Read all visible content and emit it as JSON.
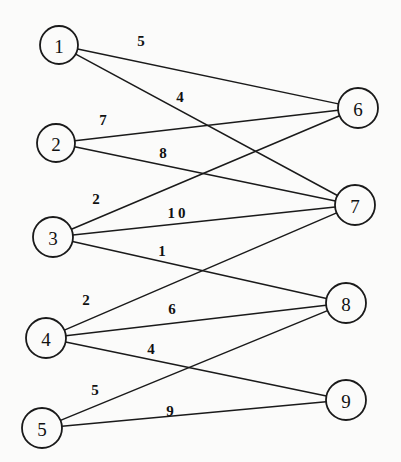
{
  "figure": {
    "kind": "bipartite-weighted-graph",
    "width": 401,
    "height": 462,
    "background_color": "#fbfbfa",
    "ink_color": "#1a1a1a"
  },
  "chart_data": {
    "type": "diagram",
    "title": "",
    "xlabel": "",
    "ylabel": "",
    "graph_type": "bipartite weighted graph",
    "left_set": [
      "1",
      "2",
      "3",
      "4",
      "5"
    ],
    "right_set": [
      "6",
      "7",
      "8",
      "9"
    ],
    "nodes": [
      {
        "id": "1",
        "label": "1",
        "side": "left",
        "cx": 59,
        "cy": 45,
        "r": 19
      },
      {
        "id": "2",
        "label": "2",
        "side": "left",
        "cx": 56,
        "cy": 143,
        "r": 19
      },
      {
        "id": "3",
        "label": "3",
        "side": "left",
        "cx": 53,
        "cy": 237,
        "r": 20
      },
      {
        "id": "4",
        "label": "4",
        "side": "left",
        "cx": 46,
        "cy": 338,
        "r": 20
      },
      {
        "id": "5",
        "label": "5",
        "side": "left",
        "cx": 42,
        "cy": 428,
        "r": 20
      },
      {
        "id": "6",
        "label": "6",
        "side": "right",
        "cx": 358,
        "cy": 108,
        "r": 20
      },
      {
        "id": "7",
        "label": "7",
        "side": "right",
        "cx": 355,
        "cy": 205,
        "r": 20
      },
      {
        "id": "8",
        "label": "8",
        "side": "right",
        "cx": 346,
        "cy": 303,
        "r": 20
      },
      {
        "id": "9",
        "label": "9",
        "side": "right",
        "cx": 346,
        "cy": 400,
        "r": 20
      }
    ],
    "edges": [
      {
        "source": "1",
        "target": "6",
        "weight": 5,
        "label": "5",
        "label_x": 141,
        "label_y": 41,
        "wide": false
      },
      {
        "source": "1",
        "target": "7",
        "weight": 4,
        "label": "4",
        "label_x": 180,
        "label_y": 97,
        "wide": false
      },
      {
        "source": "2",
        "target": "6",
        "weight": 7,
        "label": "7",
        "label_x": 103,
        "label_y": 120,
        "wide": false
      },
      {
        "source": "2",
        "target": "7",
        "weight": 8,
        "label": "8",
        "label_x": 163,
        "label_y": 153,
        "wide": false
      },
      {
        "source": "3",
        "target": "6",
        "weight": 2,
        "label": "2",
        "label_x": 96,
        "label_y": 199,
        "wide": false
      },
      {
        "source": "3",
        "target": "7",
        "weight": 10,
        "label": "10",
        "label_x": 178,
        "label_y": 213,
        "wide": true
      },
      {
        "source": "3",
        "target": "8",
        "weight": 1,
        "label": "1",
        "label_x": 162,
        "label_y": 251,
        "wide": false
      },
      {
        "source": "4",
        "target": "7",
        "weight": 2,
        "label": "2",
        "label_x": 86,
        "label_y": 300,
        "wide": false
      },
      {
        "source": "4",
        "target": "8",
        "weight": 6,
        "label": "6",
        "label_x": 172,
        "label_y": 309,
        "wide": false
      },
      {
        "source": "4",
        "target": "9",
        "weight": 4,
        "label": "4",
        "label_x": 151,
        "label_y": 349,
        "wide": false
      },
      {
        "source": "5",
        "target": "8",
        "weight": 5,
        "label": "5",
        "label_x": 95,
        "label_y": 390,
        "wide": false
      },
      {
        "source": "5",
        "target": "9",
        "weight": 9,
        "label": "9",
        "label_x": 170,
        "label_y": 411,
        "wide": false
      }
    ],
    "weights_by_pair": {
      "1-6": 5,
      "1-7": 4,
      "2-6": 7,
      "2-7": 8,
      "3-6": 2,
      "3-7": 10,
      "3-8": 1,
      "4-7": 2,
      "4-8": 6,
      "4-9": 4,
      "5-8": 5,
      "5-9": 9
    },
    "node_count": 9,
    "edge_count": 12
  }
}
